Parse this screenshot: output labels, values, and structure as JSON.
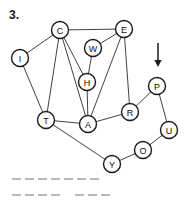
{
  "problem": {
    "number": "3."
  },
  "graph": {
    "type": "undirected-node-link-diagram",
    "node_radius": 8.5,
    "nodes": [
      {
        "id": "C",
        "label": "C",
        "x": 60,
        "y": 30
      },
      {
        "id": "E",
        "label": "E",
        "x": 124,
        "y": 29
      },
      {
        "id": "W",
        "label": "W",
        "x": 93,
        "y": 48
      },
      {
        "id": "I",
        "label": "I",
        "x": 20,
        "y": 58
      },
      {
        "id": "H",
        "label": "H",
        "x": 87,
        "y": 82
      },
      {
        "id": "P",
        "label": "P",
        "x": 157,
        "y": 86
      },
      {
        "id": "R",
        "label": "R",
        "x": 130,
        "y": 112
      },
      {
        "id": "T",
        "label": "T",
        "x": 46,
        "y": 120
      },
      {
        "id": "A",
        "label": "A",
        "x": 88,
        "y": 124
      },
      {
        "id": "U",
        "label": "U",
        "x": 169,
        "y": 130
      },
      {
        "id": "O",
        "label": "O",
        "x": 143,
        "y": 150
      },
      {
        "id": "Y",
        "label": "Y",
        "x": 112,
        "y": 164
      }
    ],
    "edges": [
      {
        "from": "C",
        "to": "E"
      },
      {
        "from": "C",
        "to": "I"
      },
      {
        "from": "C",
        "to": "T"
      },
      {
        "from": "C",
        "to": "A"
      },
      {
        "from": "C",
        "to": "H"
      },
      {
        "from": "W",
        "to": "E"
      },
      {
        "from": "W",
        "to": "H"
      },
      {
        "from": "E",
        "to": "R"
      },
      {
        "from": "E",
        "to": "A"
      },
      {
        "from": "I",
        "to": "T"
      },
      {
        "from": "H",
        "to": "A"
      },
      {
        "from": "T",
        "to": "A"
      },
      {
        "from": "T",
        "to": "Y"
      },
      {
        "from": "A",
        "to": "R"
      },
      {
        "from": "R",
        "to": "P"
      },
      {
        "from": "P",
        "to": "U"
      },
      {
        "from": "U",
        "to": "O"
      },
      {
        "from": "O",
        "to": "Y"
      }
    ],
    "pointer": {
      "name": "down-arrow",
      "points_to": "P",
      "x": 158,
      "y_top": 43,
      "y_bottom": 67
    }
  },
  "answer_lines": [
    {
      "left": 12,
      "segments": [
        {
          "dashes": 7
        }
      ]
    },
    {
      "left": 12,
      "segments": [
        {
          "dashes": 4
        },
        {
          "gap": true
        },
        {
          "dashes": 3
        }
      ]
    }
  ],
  "colors": {
    "ink": "#1a1a1a",
    "edge": "#2b2b2b",
    "dash": "#b8b8b8",
    "background": "#ffffff"
  }
}
